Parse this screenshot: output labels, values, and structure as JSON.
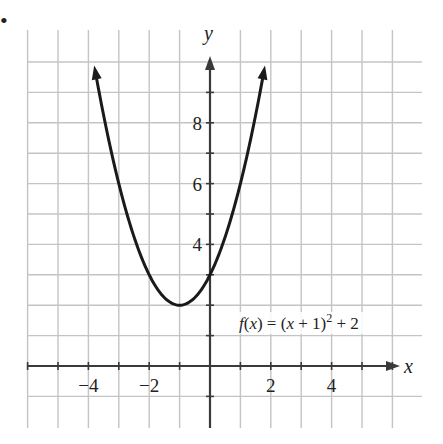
{
  "marker": "•",
  "chart_data": {
    "type": "line",
    "title": "",
    "function_label": "f(x) = (x + 1)² + 2",
    "xlabel": "x",
    "ylabel": "y",
    "xlim": [
      -6,
      7
    ],
    "ylim": [
      -2,
      11
    ],
    "x_ticks": [
      -4,
      -2,
      2,
      4
    ],
    "x_tick_labels": [
      "−4",
      "−2",
      "2",
      "4"
    ],
    "y_ticks": [
      4,
      6,
      8
    ],
    "y_tick_labels": [
      "4",
      "6",
      "8"
    ],
    "grid": true,
    "vertex": [
      -1,
      2
    ],
    "y_intercept": [
      0,
      3
    ],
    "series": [
      {
        "name": "f(x) = (x + 1)^2 + 2",
        "x": [
          -3.83,
          -3.5,
          -3,
          -2.5,
          -2,
          -1.5,
          -1,
          -0.5,
          0,
          0.5,
          1,
          1.5,
          1.83
        ],
        "y": [
          10.0,
          8.25,
          6,
          4.25,
          3,
          2.25,
          2,
          2.25,
          3,
          4.25,
          6,
          8.25,
          10.0
        ]
      }
    ]
  }
}
